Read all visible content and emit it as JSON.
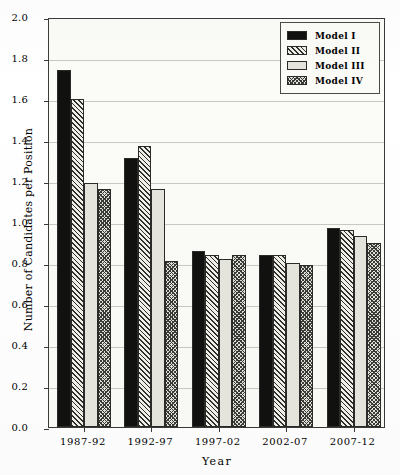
{
  "chart_data": {
    "type": "bar",
    "title": "",
    "xlabel": "Year",
    "ylabel": "Number of Candidates per Position",
    "categories": [
      "1987-92",
      "1992-97",
      "1997-02",
      "2002-07",
      "2007-12"
    ],
    "series": [
      {
        "name": "Model I",
        "values": [
          1.74,
          1.31,
          0.86,
          0.84,
          0.97
        ],
        "fill": "solid-dark",
        "color": "#111110"
      },
      {
        "name": "Model II",
        "values": [
          1.6,
          1.37,
          0.84,
          0.84,
          0.96
        ],
        "fill": "diagonal-hatch",
        "color": "#2e2e2c"
      },
      {
        "name": "Model III",
        "values": [
          1.19,
          1.16,
          0.82,
          0.8,
          0.93
        ],
        "fill": "light-solid",
        "color": "#e4e4dc"
      },
      {
        "name": "Model IV",
        "values": [
          1.16,
          0.81,
          0.84,
          0.79,
          0.9
        ],
        "fill": "cross-hatch",
        "color": "#3a3a37"
      }
    ],
    "ylim": [
      0.0,
      2.0
    ],
    "ytick_step": 0.2,
    "yticks": [
      "2.0",
      "1.8",
      "1.6",
      "1.4",
      "1.2",
      "1.0",
      "0.8",
      "0.6",
      "0.4",
      "0.2",
      "0.0"
    ],
    "grid": true,
    "legend_position": "top-right",
    "legend_entries": [
      "Model I",
      "Model II",
      "Model III",
      "Model IV"
    ]
  }
}
